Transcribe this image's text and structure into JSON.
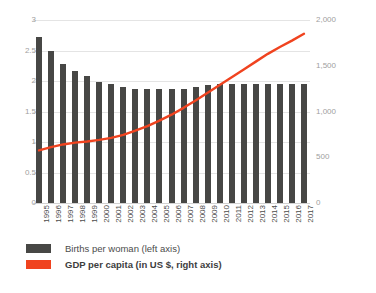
{
  "chart_data": {
    "type": "bar",
    "title": "",
    "subtitle": "",
    "xlabel": "",
    "ylabel": "",
    "grid": true,
    "legend_position": "bottom-left",
    "categories": [
      "1995",
      "1996",
      "1997",
      "1998",
      "1999",
      "2000",
      "2001",
      "2002",
      "2003",
      "2004",
      "2005",
      "2006",
      "2007",
      "2008",
      "2009",
      "2010",
      "2011",
      "2012",
      "2013",
      "2014",
      "2015",
      "2016",
      "2017"
    ],
    "left_axis": {
      "label": "Births per woman (left axis)",
      "ticks": [
        "0",
        "0.5",
        "1",
        "1.5",
        "2",
        "2.5",
        "3"
      ],
      "tick_values": [
        0,
        0.5,
        1,
        1.5,
        2,
        2.5,
        3
      ],
      "ylim": [
        0,
        3
      ]
    },
    "right_axis": {
      "label": "GDP per capita (in US $, right axis)",
      "ticks": [
        "0",
        "500",
        "1,000",
        "1,500",
        "2,000"
      ],
      "tick_values": [
        0,
        500,
        1000,
        1500,
        2000
      ],
      "ylim": [
        0,
        2000
      ]
    },
    "series": [
      {
        "name": "Births per woman (left axis)",
        "type": "bar",
        "axis": "left",
        "color": "#474745",
        "values": [
          2.72,
          2.49,
          2.28,
          2.16,
          2.09,
          1.99,
          1.95,
          1.9,
          1.87,
          1.87,
          1.87,
          1.87,
          1.87,
          1.9,
          1.93,
          1.95,
          1.95,
          1.95,
          1.95,
          1.95,
          1.95,
          1.95,
          1.95
        ]
      },
      {
        "name": "GDP per capita (in US $, right axis)",
        "type": "line",
        "axis": "right",
        "color": "#f0431f",
        "values": [
          575,
          610,
          640,
          660,
          672,
          690,
          712,
          745,
          790,
          840,
          900,
          965,
          1040,
          1120,
          1205,
          1290,
          1375,
          1460,
          1545,
          1630,
          1705,
          1775,
          1850
        ]
      }
    ]
  },
  "legend": {
    "items": [
      {
        "label": "Births per woman (left axis)",
        "color": "#474745",
        "marker": "bar-swatch"
      },
      {
        "label": "GDP per capita (in US $, right axis)",
        "color": "#f0431f",
        "marker": "line-swatch"
      }
    ]
  }
}
